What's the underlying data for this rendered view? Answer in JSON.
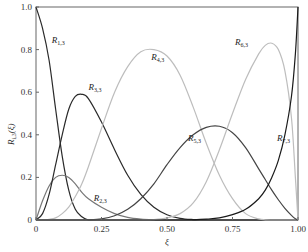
{
  "chart_data": {
    "type": "line",
    "title": "",
    "xlabel": "ξ",
    "ylabel": "R_{i,3}(ξ)",
    "xlim": [
      0,
      1
    ],
    "ylim": [
      0,
      1
    ],
    "grid": false,
    "x_ticks": [
      "0",
      "0.25",
      "0.50",
      "0.75",
      "1.00"
    ],
    "y_ticks": [
      "0",
      "0.2",
      "0.4",
      "0.6",
      "0.8",
      "1.0"
    ],
    "x": [
      0,
      0.025,
      0.05,
      0.075,
      0.1,
      0.125,
      0.15,
      0.175,
      0.2,
      0.25,
      0.3,
      0.35,
      0.4,
      0.45,
      0.5,
      0.55,
      0.6,
      0.65,
      0.7,
      0.75,
      0.8,
      0.85,
      0.875,
      0.9,
      0.925,
      0.95,
      0.975,
      0.99,
      1.0
    ],
    "series": [
      {
        "name": "R1,3",
        "label_main": "R",
        "label_sub": "1,3",
        "color": "#2a2a2a",
        "values": [
          1.0,
          0.9,
          0.75,
          0.52,
          0.3,
          0.14,
          0.05,
          0.015,
          0.0,
          0,
          0,
          0,
          0,
          0,
          0,
          0,
          0,
          0,
          0,
          0,
          0,
          0,
          0,
          0,
          0,
          0,
          0,
          0,
          0
        ]
      },
      {
        "name": "R2,3",
        "label_main": "R",
        "label_sub": "2,3",
        "color": "#777777",
        "values": [
          0.0,
          0.09,
          0.16,
          0.2,
          0.21,
          0.2,
          0.17,
          0.13,
          0.1,
          0.06,
          0.03,
          0.012,
          0.004,
          0.001,
          0,
          0,
          0,
          0,
          0,
          0,
          0,
          0,
          0,
          0,
          0,
          0,
          0,
          0,
          0
        ]
      },
      {
        "name": "R3,3",
        "label_main": "R",
        "label_sub": "3,3",
        "color": "#2a2a2a",
        "values": [
          0.0,
          0.03,
          0.12,
          0.26,
          0.4,
          0.52,
          0.58,
          0.59,
          0.57,
          0.46,
          0.33,
          0.21,
          0.12,
          0.06,
          0.025,
          0.008,
          0.002,
          0,
          0,
          0,
          0,
          0,
          0,
          0,
          0,
          0,
          0,
          0,
          0
        ]
      },
      {
        "name": "R4,3",
        "label_main": "R",
        "label_sub": "4,3",
        "color": "#bdbdbd",
        "values": [
          0.0,
          0.0,
          0.003,
          0.01,
          0.03,
          0.06,
          0.11,
          0.17,
          0.25,
          0.43,
          0.6,
          0.72,
          0.79,
          0.8,
          0.77,
          0.68,
          0.53,
          0.36,
          0.21,
          0.1,
          0.03,
          0.005,
          0.001,
          0,
          0,
          0,
          0,
          0,
          0
        ]
      },
      {
        "name": "R5,3",
        "label_main": "R",
        "label_sub": "5,3",
        "color": "#444444",
        "values": [
          0,
          0,
          0,
          0,
          0,
          0,
          0,
          0,
          0,
          0.005,
          0.02,
          0.05,
          0.1,
          0.17,
          0.26,
          0.34,
          0.4,
          0.435,
          0.44,
          0.41,
          0.34,
          0.24,
          0.19,
          0.14,
          0.095,
          0.055,
          0.022,
          0.006,
          0.0
        ]
      },
      {
        "name": "R6,3",
        "label_main": "R",
        "label_sub": "6,3",
        "color": "#bdbdbd",
        "values": [
          0,
          0,
          0,
          0,
          0,
          0,
          0,
          0,
          0,
          0,
          0,
          0,
          0,
          0.002,
          0.01,
          0.03,
          0.08,
          0.18,
          0.33,
          0.5,
          0.66,
          0.78,
          0.82,
          0.83,
          0.8,
          0.7,
          0.48,
          0.2,
          0.0
        ]
      },
      {
        "name": "R7,3",
        "label_main": "R",
        "label_sub": "7,3",
        "color": "#1a1a1a",
        "values": [
          0,
          0,
          0,
          0,
          0,
          0,
          0,
          0,
          0,
          0,
          0,
          0,
          0,
          0,
          0,
          0,
          0.001,
          0.004,
          0.01,
          0.025,
          0.05,
          0.1,
          0.14,
          0.2,
          0.28,
          0.4,
          0.58,
          0.78,
          1.0
        ]
      }
    ],
    "annotations": [
      {
        "text_main": "R",
        "text_sub": "1,3",
        "x": 0.06,
        "y": 0.83
      },
      {
        "text_main": "R",
        "text_sub": "3,3",
        "x": 0.2,
        "y": 0.61
      },
      {
        "text_main": "R",
        "text_sub": "2,3",
        "x": 0.22,
        "y": 0.09
      },
      {
        "text_main": "R",
        "text_sub": "4,3",
        "x": 0.44,
        "y": 0.75
      },
      {
        "text_main": "R",
        "text_sub": "5,3",
        "x": 0.58,
        "y": 0.37
      },
      {
        "text_main": "R",
        "text_sub": "6,3",
        "x": 0.76,
        "y": 0.82
      },
      {
        "text_main": "R",
        "text_sub": "7,3",
        "x": 0.92,
        "y": 0.37
      }
    ]
  },
  "axes": {
    "xlabel": "ξ",
    "ylabel_main": "R",
    "ylabel_sub": "i,3",
    "ylabel_arg": "(ξ)"
  }
}
